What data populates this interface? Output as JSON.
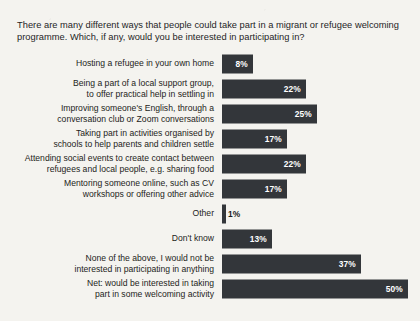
{
  "page": {
    "top_partial_text": "",
    "background_color": "#f4f3ef",
    "bar_color": "#33363a",
    "value_text_color": "#ffffff"
  },
  "question": {
    "text": "There are many different ways that people could take part in a migrant or refugee welcoming programme. Which, if any, would you be interested in participating in?"
  },
  "chart_data": {
    "type": "bar",
    "orientation": "horizontal",
    "title": "There are many different ways that people could take part in a migrant or refugee welcoming programme. Which, if any, would you be interested in participating in?",
    "xlabel": "",
    "ylabel": "",
    "xlim": [
      0,
      50
    ],
    "grid": false,
    "legend": null,
    "value_suffix": "%",
    "categories": [
      "Hosting a refugee in your own home",
      "Being a part of a local support group, to offer practical help in settling in",
      "Improving someone's English, through a conversation club or Zoom conversations",
      "Taking part in activities organised by schools to help parents and children settle",
      "Attending social events to create contact between refugees and local people, e.g. sharing food",
      "Mentoring someone online, such as CV workshops or offering other advice",
      "Other",
      "Don't know",
      "None of the above, I would not be interested in participating in anything",
      "Net: would be interested in taking part in some welcoming activity"
    ],
    "values": [
      8,
      22,
      25,
      17,
      22,
      17,
      1,
      13,
      37,
      50
    ],
    "value_labels": [
      "8%",
      "22%",
      "25%",
      "17%",
      "22%",
      "17%",
      "1%",
      "13%",
      "37%",
      "50%"
    ]
  },
  "rows": [
    {
      "label_line1": "Hosting a refugee in your own home",
      "label_line2": "",
      "value": "8%",
      "width_px": 31,
      "label_outside": false
    },
    {
      "label_line1": "Being a part of a local support group,",
      "label_line2": "to offer practical help in settling in",
      "value": "22%",
      "width_px": 84,
      "label_outside": false
    },
    {
      "label_line1": "Improving someone's English, through a",
      "label_line2": "conversation club or Zoom conversations",
      "value": "25%",
      "width_px": 95,
      "label_outside": false
    },
    {
      "label_line1": "Taking part in activities organised by",
      "label_line2": "schools to help parents and children settle",
      "value": "17%",
      "width_px": 65,
      "label_outside": false
    },
    {
      "label_line1": "Attending social events to create contact between",
      "label_line2": "refugees and local people, e.g. sharing food",
      "value": "22%",
      "width_px": 84,
      "label_outside": false
    },
    {
      "label_line1": "Mentoring someone online, such as CV",
      "label_line2": "workshops or offering other advice",
      "value": "17%",
      "width_px": 65,
      "label_outside": false
    },
    {
      "label_line1": "Other",
      "label_line2": "",
      "value": "1%",
      "width_px": 4,
      "label_outside": true
    },
    {
      "label_line1": "Don't know",
      "label_line2": "",
      "value": "13%",
      "width_px": 50,
      "label_outside": false
    },
    {
      "label_line1": "None of the above, I would not be",
      "label_line2": "interested in participating in anything",
      "value": "37%",
      "width_px": 139,
      "label_outside": false
    },
    {
      "label_line1": "Net: would be interested in taking",
      "label_line2": "part in some welcoming activity",
      "value": "50%",
      "width_px": 186,
      "label_outside": false
    }
  ]
}
